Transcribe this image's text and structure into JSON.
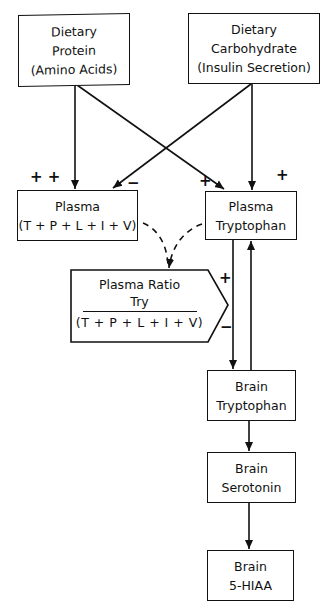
{
  "diagram": {
    "nodes": {
      "dietary_protein": {
        "line1": "Dietary",
        "line2": "Protein",
        "line3": "(Amino Acids)"
      },
      "dietary_carbohydrate": {
        "line1": "Dietary",
        "line2": "Carbohydrate",
        "line3": "(Insulin Secretion)"
      },
      "plasma_lnaa": {
        "line1": "Plasma",
        "line2": "(T + P + L + I + V)"
      },
      "plasma_tryptophan": {
        "line1": "Plasma",
        "line2": "Tryptophan"
      },
      "plasma_ratio": {
        "line1": "Plasma Ratio",
        "numerator": "Try",
        "denominator": "(T + P + L + I + V)"
      },
      "brain_tryptophan": {
        "line1": "Brain",
        "line2": "Tryptophan"
      },
      "brain_serotonin": {
        "line1": "Brain",
        "line2": "Serotonin"
      },
      "brain_5hiaa": {
        "line1": "Brain",
        "line2": "5-HIAA"
      }
    },
    "signs": {
      "protein_to_plasma": "+ +",
      "carb_to_plasma": "−",
      "protein_to_tryptophan": "+",
      "carb_to_tryptophan": "+",
      "ratio_plus": "+",
      "ratio_minus": "−"
    },
    "edges": [
      {
        "from": "dietary_protein",
        "to": "plasma_lnaa",
        "style": "solid",
        "sign": "+ +"
      },
      {
        "from": "dietary_protein",
        "to": "plasma_tryptophan",
        "style": "solid",
        "sign": "+"
      },
      {
        "from": "dietary_carbohydrate",
        "to": "plasma_lnaa",
        "style": "solid",
        "sign": "−"
      },
      {
        "from": "dietary_carbohydrate",
        "to": "plasma_tryptophan",
        "style": "solid",
        "sign": "+"
      },
      {
        "from": "plasma_lnaa",
        "to": "plasma_ratio",
        "style": "dashed"
      },
      {
        "from": "plasma_tryptophan",
        "to": "plasma_ratio",
        "style": "dashed"
      },
      {
        "from": "plasma_tryptophan",
        "to": "brain_tryptophan",
        "style": "solid"
      },
      {
        "from": "brain_tryptophan",
        "to": "plasma_tryptophan",
        "style": "solid"
      },
      {
        "from": "brain_tryptophan",
        "to": "brain_serotonin",
        "style": "solid"
      },
      {
        "from": "brain_serotonin",
        "to": "brain_5hiaa",
        "style": "solid"
      }
    ]
  }
}
